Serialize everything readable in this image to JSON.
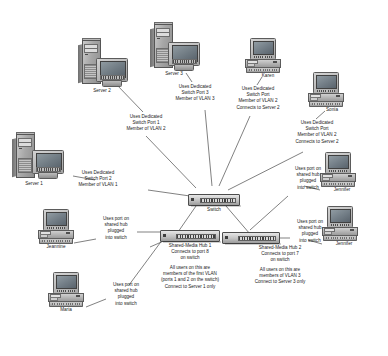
{
  "diagram": {
    "colors": {
      "text": "#1a1a1a",
      "wire": "#4a4a4a",
      "device_light": "#d2d2d2",
      "device_dark": "#8e8e8e",
      "screen": "#717c85"
    },
    "devices": {
      "server2": {
        "label": "Server 2",
        "icon": "server-tower-icon"
      },
      "server3": {
        "label": "Server 3",
        "icon": "server-tower-icon"
      },
      "server1": {
        "label": "Server 1",
        "icon": "server-tower-icon"
      },
      "karen": {
        "label": "Karen",
        "icon": "desktop-computer-icon"
      },
      "sonia": {
        "label": "Sonia",
        "icon": "desktop-computer-icon"
      },
      "jennifer1": {
        "label": "Jennifer",
        "icon": "desktop-computer-icon"
      },
      "jennifer2": {
        "label": "Jennifer",
        "icon": "desktop-computer-icon"
      },
      "jeannine": {
        "label": "Jeannine",
        "icon": "desktop-computer-icon"
      },
      "maria": {
        "label": "Maria",
        "icon": "desktop-computer-icon"
      },
      "switch": {
        "label": "Switch",
        "icon": "network-switch-icon"
      },
      "hub1": {
        "label": "Shared-Media Hub 1",
        "icon": "network-hub-icon"
      },
      "hub2": {
        "label": "Shared-Media Hub 2",
        "icon": "network-hub-icon"
      }
    },
    "annotations": {
      "server2_note": [
        "Uses Dedicated",
        "Switch Port 1",
        "Member of VLAN 2"
      ],
      "server3_note": [
        "Uses Dedicated",
        "Switch Port 3",
        "Member of VLAN 3"
      ],
      "server1_note": [
        "Uses Dedicated",
        "Switch Port 2",
        "Member of VLAN 1"
      ],
      "karen_note": [
        "Uses Dedicated",
        "Switch Port",
        "Member of VLAN 2",
        "Connects to Server 2"
      ],
      "sonia_note": [
        "Uses Dedicated",
        "Switch Port",
        "Member of VLAN 2",
        "Connects to Server 2"
      ],
      "jennifer1_note": [
        "Uses port on",
        "shared hub",
        "plugged",
        "into switch"
      ],
      "jennifer2_note": [
        "Uses port on",
        "shared hub",
        "plugged",
        "into switch"
      ],
      "jeannine_note": [
        "Uses port on",
        "shared hub",
        "plugged",
        "into switch"
      ],
      "maria_note": [
        "Uses port on",
        "shared hub",
        "plugged",
        "into switch"
      ],
      "hub1_caption": [
        "Shared-Media Hub 1",
        "Connects to port 8",
        "on switch"
      ],
      "hub1_legend": [
        "All users on this are",
        "members of the first VLAN",
        "(ports 1 and 2 on the switch)",
        "Connect to Server 1 only"
      ],
      "hub2_caption": [
        "Shared-Media Hub 2",
        "Connects to port 7",
        "on switch"
      ],
      "hub2_legend": [
        "All users on this are",
        "members of VLAN 3",
        "Connect to Server 3 only"
      ]
    }
  }
}
